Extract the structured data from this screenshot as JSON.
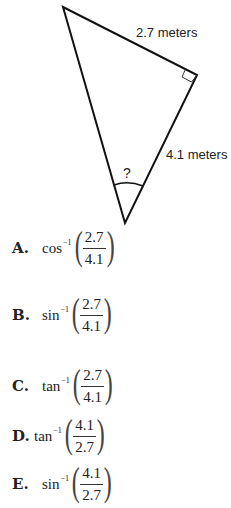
{
  "figure": {
    "vertices": {
      "top": [
        63,
        7
      ],
      "right": [
        197,
        75
      ],
      "bottom": [
        125,
        223
      ]
    },
    "labels": {
      "hypotenuse_side": "2.7 meters",
      "right_side": "4.1 meters",
      "angle": "?"
    },
    "right_angle_at": "right"
  },
  "choices": [
    {
      "letter": "A.",
      "fn": "cos",
      "exp": "−1",
      "num": "2.7",
      "den": "4.1"
    },
    {
      "letter": "B.",
      "fn": "sin",
      "exp": "−1",
      "num": "2.7",
      "den": "4.1"
    },
    {
      "letter": "C.",
      "fn": "tan",
      "exp": "−1",
      "num": "2.7",
      "den": "4.1"
    },
    {
      "letter": "D.",
      "fn": "tan",
      "exp": "−1",
      "num": "4.1",
      "den": "2.7"
    },
    {
      "letter": "E.",
      "fn": "sin",
      "exp": "−1",
      "num": "4.1",
      "den": "2.7"
    }
  ]
}
